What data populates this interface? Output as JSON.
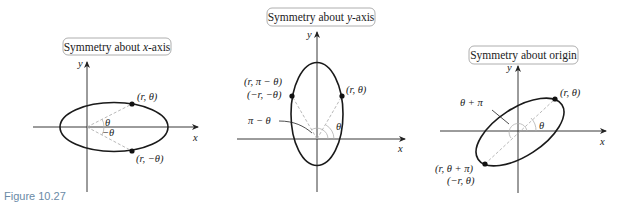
{
  "figure": {
    "label": "Figure 10.27",
    "panels": [
      {
        "title": "Symmetry about x-axis",
        "title_parts": [
          "Symmetry about ",
          "x",
          "-axis"
        ],
        "axis_x": "x",
        "axis_y": "y",
        "points": [
          {
            "label": "(r, θ)"
          },
          {
            "label": "(r, −θ)"
          }
        ],
        "angles": [
          "θ",
          "−θ"
        ]
      },
      {
        "title": "Symmetry about y-axis",
        "title_parts": [
          "Symmetry about ",
          "y",
          "-axis"
        ],
        "axis_x": "x",
        "axis_y": "y",
        "points": [
          {
            "label": "(r, θ)"
          },
          {
            "label": "(r, π − θ)",
            "label2": "(−r, −θ)"
          }
        ],
        "angles": [
          "θ",
          "π − θ"
        ]
      },
      {
        "title": "Symmetry about origin",
        "title_parts": [
          "Symmetry about origin"
        ],
        "axis_x": "x",
        "axis_y": "y",
        "points": [
          {
            "label": "(r, θ)"
          },
          {
            "label": "(r, θ + π)",
            "label2": "(−r, θ)"
          }
        ],
        "angles": [
          "θ",
          "θ + π"
        ]
      }
    ]
  },
  "colors": {
    "curve": "#1a1a1a",
    "axis": "#222222",
    "dashed": "#b0b0b0",
    "title_box": "#9a9a9a",
    "figure_label": "#6a8aa6"
  }
}
